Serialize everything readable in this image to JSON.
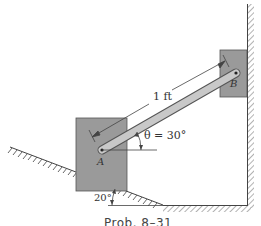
{
  "figure": {
    "caption": "Prob. 8–31",
    "labels": {
      "length": "1 ft",
      "point_a": "A",
      "point_b": "B",
      "theta": "θ = 30°",
      "incline_angle": "20°"
    },
    "colors": {
      "block_fill": "#9a9a9a",
      "block_stroke": "#555555",
      "rod_fill": "#c8c8c8",
      "rod_stroke": "#555555",
      "line": "#444444"
    }
  }
}
